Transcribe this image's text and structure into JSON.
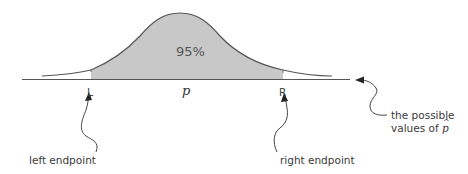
{
  "diagram": {
    "type": "normal-distribution-confidence-interval",
    "shaded_area_label": "95%",
    "center_label": "p",
    "left_endpoint_marker": "L",
    "right_endpoint_marker": "R",
    "annotations": {
      "left_endpoint": "left endpoint",
      "right_endpoint": "right endpoint",
      "axis_line1": "the possible",
      "axis_line2_prefix": "values of ",
      "axis_line2_symbol": "p"
    },
    "colors": {
      "shade": "#c8c8c8",
      "curve": "#555555",
      "axis": "#555555",
      "text": "#3a3a3a"
    }
  }
}
